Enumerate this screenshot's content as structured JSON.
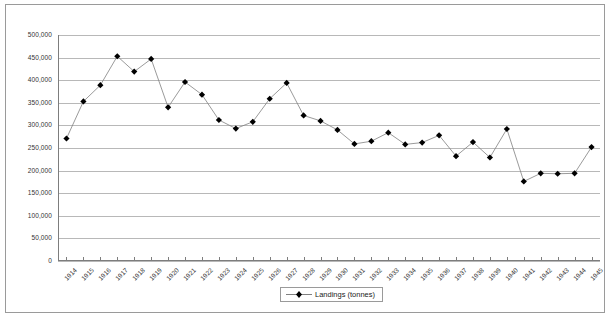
{
  "chart_data": {
    "type": "line",
    "title": "",
    "subtitle": "",
    "xlabel": "",
    "ylabel": "",
    "grid": true,
    "legend_position": "bottom-center",
    "marker": "diamond",
    "series_name": "Landings (tonnes)",
    "series_color": "#000000",
    "line_color": "#808080",
    "gridline_color": "#b8b8b8",
    "axis_color": "#7d7d7d",
    "ylim": [
      0,
      500000
    ],
    "ytick_values": [
      0,
      50000,
      100000,
      150000,
      200000,
      250000,
      300000,
      350000,
      400000,
      450000,
      500000
    ],
    "ytick_labels": [
      "0",
      "50,000",
      "100,000",
      "150,000",
      "200,000",
      "250,000",
      "300,000",
      "350,000",
      "400,000",
      "450,000",
      "500,000"
    ],
    "categories": [
      "1914",
      "1915",
      "1916",
      "1917",
      "1918",
      "1919",
      "1920",
      "1921",
      "1922",
      "1923",
      "1924",
      "1925",
      "1926",
      "1927",
      "1928",
      "1929",
      "1930",
      "1931",
      "1932",
      "1933",
      "1934",
      "1935",
      "1936",
      "1937",
      "1938",
      "1939",
      "1940",
      "1941",
      "1942",
      "1943",
      "1944",
      "1945"
    ],
    "values": [
      271000,
      353000,
      389000,
      453000,
      419000,
      447000,
      340000,
      396000,
      368000,
      312000,
      293000,
      308000,
      359000,
      394000,
      322000,
      310000,
      290000,
      259000,
      265000,
      284000,
      258000,
      262000,
      278000,
      232000,
      263000,
      229000,
      292000,
      176000,
      194000,
      193000,
      194000,
      252000
    ],
    "series": [
      {
        "name": "Landings (tonnes)",
        "values": [
          271000,
          353000,
          389000,
          453000,
          419000,
          447000,
          340000,
          396000,
          368000,
          312000,
          293000,
          308000,
          359000,
          394000,
          322000,
          310000,
          290000,
          259000,
          265000,
          284000,
          258000,
          262000,
          278000,
          232000,
          263000,
          229000,
          292000,
          176000,
          194000,
          193000,
          194000,
          252000
        ]
      }
    ]
  },
  "legend": {
    "entries": [
      {
        "label": "Landings (tonnes)",
        "marker": "diamond",
        "color": "#000000"
      }
    ]
  }
}
